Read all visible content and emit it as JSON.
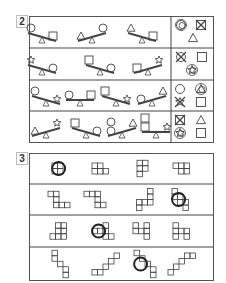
{
  "section2": {
    "number": "2",
    "rows": [
      {
        "seesaws": [
          {
            "x": 42,
            "left": "circle",
            "right": "square",
            "tilt": "right-up"
          },
          {
            "x": 92,
            "left": "triangle",
            "right": "circle",
            "tilt": "left-up"
          },
          {
            "x": 142,
            "left": "triangle",
            "right": "square",
            "tilt": "right-up"
          }
        ],
        "answers": [
          "circle-circled",
          "square-crossed",
          "triangle"
        ]
      },
      {
        "seesaws": [
          {
            "x": 42,
            "left": "star",
            "right": "circle",
            "tilt": "right-up"
          },
          {
            "x": 100,
            "left": "square",
            "right": "circle",
            "tilt": "right-up"
          },
          {
            "x": 148,
            "left": "square",
            "right": "star",
            "tilt": "left-up"
          }
        ],
        "answers": [
          "circle-crossed",
          "square",
          "star-circled"
        ]
      },
      {
        "seesaws": [
          {
            "x": 46,
            "left": "circle",
            "right": "star",
            "tilt": "right-up"
          },
          {
            "x": 80,
            "left": "circle",
            "right": "square",
            "tilt": "level"
          },
          {
            "x": 116,
            "left": "square",
            "right": "star",
            "tilt": "right-up"
          },
          {
            "x": 152,
            "left": "circle",
            "right": "triangle",
            "tilt": "left-up"
          }
        ],
        "answers": [
          "circle",
          "triangle-circled",
          "star-crossed",
          "square"
        ]
      },
      {
        "seesaws": [
          {
            "x": 46,
            "left": "triangle",
            "right": "star",
            "tilt": "left-up"
          },
          {
            "x": 86,
            "left": "square",
            "right": "circle",
            "tilt": "right-up"
          },
          {
            "x": 122,
            "left": "circle-stack",
            "right": "triangle",
            "tilt": "left-up"
          },
          {
            "x": 156,
            "left": "square-stack",
            "right": "star",
            "tilt": "level"
          }
        ],
        "answers": [
          "square-crossed",
          "triangle",
          "star-circled",
          "square"
        ]
      }
    ]
  },
  "section3": {
    "number": "3",
    "rows": [
      {
        "figures": [
          {
            "x": 52,
            "cells": [
              [
                0,
                0
              ],
              [
                1,
                0
              ],
              [
                0,
                1
              ],
              [
                1,
                1
              ]
            ],
            "circled": true
          },
          {
            "x": 92,
            "cells": [
              [
                0,
                0
              ],
              [
                1,
                0
              ],
              [
                0,
                1
              ],
              [
                1,
                1
              ],
              [
                2,
                1
              ]
            ],
            "circled": false
          },
          {
            "x": 137,
            "cells": [
              [
                0,
                0
              ],
              [
                1,
                0
              ],
              [
                0,
                1
              ],
              [
                1,
                1
              ],
              [
                0,
                2
              ]
            ],
            "circled": false
          },
          {
            "x": 173,
            "cells": [
              [
                0,
                0
              ],
              [
                1,
                0
              ],
              [
                2,
                0
              ],
              [
                1,
                1
              ],
              [
                2,
                1
              ]
            ],
            "circled": false
          }
        ]
      },
      {
        "figures": [
          {
            "x": 48,
            "cells": [
              [
                0,
                0
              ],
              [
                1,
                0
              ],
              [
                1,
                1
              ],
              [
                1,
                2
              ],
              [
                2,
                2
              ],
              [
                3,
                2
              ]
            ],
            "circled": false
          },
          {
            "x": 84,
            "cells": [
              [
                0,
                0
              ],
              [
                1,
                0
              ],
              [
                2,
                0
              ],
              [
                2,
                1
              ],
              [
                2,
                2
              ],
              [
                3,
                2
              ]
            ],
            "circled": false
          },
          {
            "x": 131,
            "cells": [
              [
                3,
                0
              ],
              [
                3,
                1
              ],
              [
                2,
                2
              ],
              [
                3,
                2
              ],
              [
                1,
                2
              ],
              [
                1,
                3
              ]
            ],
            "circled": false
          },
          {
            "x": 172,
            "cells": [
              [
                0,
                0
              ],
              [
                0,
                1
              ],
              [
                1,
                1
              ],
              [
                1,
                2
              ],
              [
                2,
                2
              ],
              [
                2,
                3
              ]
            ],
            "circled": true
          }
        ]
      },
      {
        "figures": [
          {
            "x": 50,
            "cells": [
              [
                1,
                0
              ],
              [
                2,
                0
              ],
              [
                1,
                1
              ],
              [
                2,
                1
              ],
              [
                0,
                2
              ],
              [
                1,
                2
              ],
              [
                2,
                2
              ]
            ],
            "circled": false
          },
          {
            "x": 92,
            "cells": [
              [
                2,
                0
              ],
              [
                0,
                1
              ],
              [
                1,
                1
              ],
              [
                2,
                1
              ],
              [
                2,
                2
              ],
              [
                3,
                2
              ]
            ],
            "circled": true
          },
          {
            "x": 133,
            "cells": [
              [
                0,
                0
              ],
              [
                2,
                0
              ],
              [
                0,
                1
              ],
              [
                1,
                1
              ],
              [
                2,
                1
              ],
              [
                2,
                2
              ]
            ],
            "circled": false
          },
          {
            "x": 173,
            "cells": [
              [
                0,
                0
              ],
              [
                0,
                1
              ],
              [
                1,
                1
              ],
              [
                2,
                1
              ],
              [
                0,
                2
              ],
              [
                2,
                2
              ]
            ],
            "circled": false
          }
        ]
      },
      {
        "figures": [
          {
            "x": 52,
            "cells": [
              [
                0,
                0
              ],
              [
                0,
                1
              ],
              [
                1,
                2
              ],
              [
                2,
                3
              ],
              [
                2,
                4
              ]
            ],
            "circled": false
          },
          {
            "x": 92,
            "cells": [
              [
                0,
                3
              ],
              [
                1,
                3
              ],
              [
                2,
                2
              ],
              [
                3,
                1
              ],
              [
                4,
                0
              ]
            ],
            "circled": false
          },
          {
            "x": 134,
            "cells": [
              [
                0,
                0
              ],
              [
                1,
                1
              ],
              [
                2,
                2
              ],
              [
                3,
                3
              ],
              [
                3,
                4
              ]
            ],
            "circled": true
          },
          {
            "x": 168,
            "cells": [
              [
                0,
                3
              ],
              [
                1,
                2
              ],
              [
                2,
                1
              ],
              [
                3,
                0
              ],
              [
                4,
                0
              ]
            ],
            "circled": false
          }
        ]
      }
    ]
  }
}
